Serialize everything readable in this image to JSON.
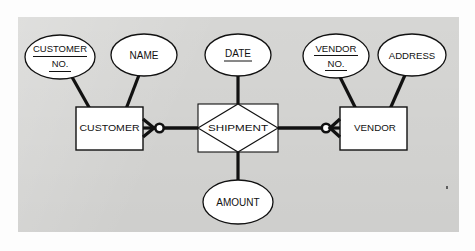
{
  "diagram": {
    "notation": "crow's-foot",
    "background_color": "#d6d6d4",
    "page_color": "#fdfdfd",
    "line_color": "#111111",
    "shape_fill": "#ffffff"
  },
  "entities": [
    {
      "id": "customer",
      "label": "CUSTOMER",
      "shape": "rectangle",
      "x": 76,
      "y": 107,
      "w": 67,
      "h": 43
    },
    {
      "id": "vendor",
      "label": "VENDOR",
      "shape": "rectangle",
      "x": 340,
      "y": 107,
      "w": 67,
      "h": 43
    }
  ],
  "relationships": [
    {
      "id": "shipment",
      "label": "SHIPMENT",
      "shape": "diamond-in-rectangle",
      "x": 198,
      "y": 106,
      "w": 80,
      "h": 48,
      "connects": [
        "customer",
        "vendor"
      ]
    }
  ],
  "attributes": [
    {
      "id": "customer-no",
      "lines": [
        "CUSTOMER",
        "NO."
      ],
      "underline": [
        true,
        true
      ],
      "key": true,
      "owner": "customer",
      "cx": 60,
      "cy": 57,
      "rx": 35,
      "ry": 22
    },
    {
      "id": "name",
      "lines": [
        "NAME"
      ],
      "underline": [
        false
      ],
      "key": false,
      "owner": "customer",
      "cx": 144,
      "cy": 55,
      "rx": 33,
      "ry": 21
    },
    {
      "id": "date",
      "lines": [
        "DATE"
      ],
      "underline": [
        true
      ],
      "key": true,
      "owner": "shipment",
      "cx": 238,
      "cy": 55,
      "rx": 33,
      "ry": 21
    },
    {
      "id": "vendor-no",
      "lines": [
        "VENDOR",
        "NO."
      ],
      "underline": [
        true,
        true
      ],
      "key": true,
      "owner": "vendor",
      "cx": 336,
      "cy": 56,
      "rx": 33,
      "ry": 22
    },
    {
      "id": "address",
      "lines": [
        "ADDRESS"
      ],
      "underline": [
        false
      ],
      "key": false,
      "owner": "vendor",
      "cx": 412,
      "cy": 55,
      "rx": 34,
      "ry": 21
    },
    {
      "id": "amount",
      "lines": [
        "AMOUNT"
      ],
      "underline": [
        false
      ],
      "key": false,
      "owner": "shipment",
      "cx": 238,
      "cy": 202,
      "rx": 35,
      "ry": 22
    }
  ],
  "connectors": [
    {
      "id": "customer-to-shipment",
      "from": "customer",
      "to": "shipment",
      "cardinality_near_customer": "zero-or-many",
      "symbols": [
        "crow-foot",
        "circle"
      ]
    },
    {
      "id": "shipment-to-vendor",
      "from": "shipment",
      "to": "vendor",
      "cardinality_near_vendor": "zero-or-many",
      "symbols": [
        "circle",
        "crow-foot"
      ]
    },
    {
      "id": "date-to-shipment",
      "from": "date",
      "to": "shipment"
    },
    {
      "id": "amount-to-shipment",
      "from": "amount",
      "to": "shipment"
    },
    {
      "id": "customerno-to-customer",
      "from": "customer-no",
      "to": "customer"
    },
    {
      "id": "name-to-customer",
      "from": "name",
      "to": "customer"
    },
    {
      "id": "vendorno-to-vendor",
      "from": "vendor-no",
      "to": "vendor"
    },
    {
      "id": "address-to-vendor",
      "from": "address",
      "to": "vendor"
    }
  ],
  "text": {
    "customer": "CUSTOMER",
    "vendor": "VENDOR",
    "shipment": "SHIPMENT",
    "customer_no_line1": "CUSTOMER",
    "customer_no_line2": "NO.",
    "name": "NAME",
    "date": "DATE",
    "vendor_no_line1": "VENDOR",
    "vendor_no_line2": "NO.",
    "address": "ADDRESS",
    "amount": "AMOUNT"
  }
}
